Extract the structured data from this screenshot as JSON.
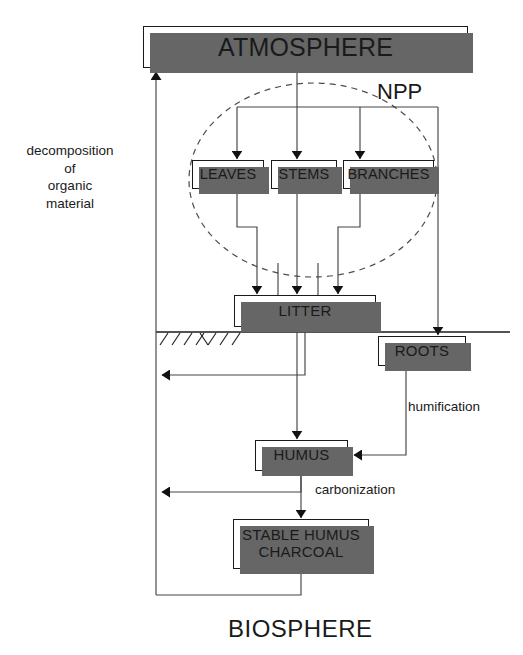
{
  "diagram": {
    "colors": {
      "stroke": "#1a1a1a",
      "shadow": "#666666",
      "background": "#ffffff",
      "dashed_ellipse": "#4d4d4d"
    },
    "boxes": {
      "atmosphere": "ATMOSPHERE",
      "leaves": "LEAVES",
      "stems": "STEMS",
      "branches": "BRANCHES",
      "litter": "LITTER",
      "roots": "ROOTS",
      "humus": "HUMUS",
      "stable_humus_line1": "STABLE HUMUS",
      "stable_humus_line2": "CHARCOAL"
    },
    "labels": {
      "npp": "NPP",
      "decomposition": "decomposition\nof\norganic\nmaterial",
      "humification": "humification",
      "carbonization": "carbonization",
      "biosphere": "BIOSPHERE"
    },
    "annotations": {
      "ground_line": "soil-surface",
      "npp_ellipse": "net-primary-production-grouping"
    }
  }
}
